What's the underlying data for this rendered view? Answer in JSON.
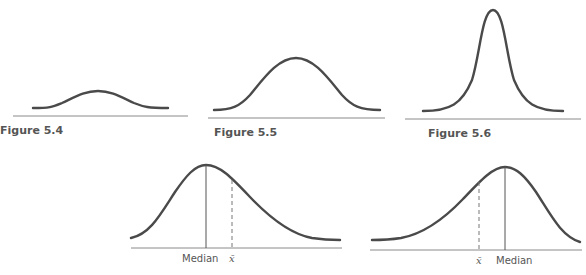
{
  "figures": [
    {
      "id": "fig-5-4",
      "caption": "Figure 5.4",
      "description": "Flat, wide symmetric bell curve (platykurtic)"
    },
    {
      "id": "fig-5-5",
      "caption": "Figure 5.5",
      "description": "Normal symmetric bell curve (mesokurtic)"
    },
    {
      "id": "fig-5-6",
      "caption": "Figure 5.6",
      "description": "Tall, narrow symmetric peak (leptokurtic)"
    },
    {
      "id": "fig-skew-right",
      "description": "Positively skewed curve with mean to the right of median",
      "labels": {
        "median": "Median",
        "mean": "x̄"
      }
    },
    {
      "id": "fig-skew-left",
      "description": "Negatively skewed curve with mean to the left of median",
      "labels": {
        "median": "Median",
        "mean": "x̄"
      }
    }
  ],
  "colors": {
    "curve": "#4a4a4a",
    "axis": "#8a8a8a",
    "text": "#555555"
  }
}
